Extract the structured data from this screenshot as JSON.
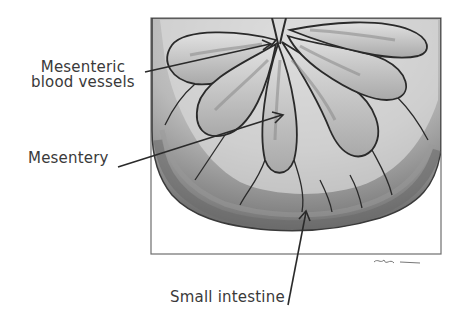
{
  "figure": {
    "labels": {
      "mesenteric_vessels_line1": "Mesenteric",
      "mesenteric_vessels_line2": "blood vessels",
      "mesentery": "Mesentery",
      "small_intestine": "Small intestine"
    },
    "colors": {
      "background": "#ffffff",
      "frame": "#6e6e6e",
      "ink": "#2a2a2a",
      "shade_dark": "#7a7a7a",
      "shade_mid": "#a8a8a8",
      "shade_light": "#d6d6d6",
      "label_text": "#3a3a3a"
    }
  }
}
